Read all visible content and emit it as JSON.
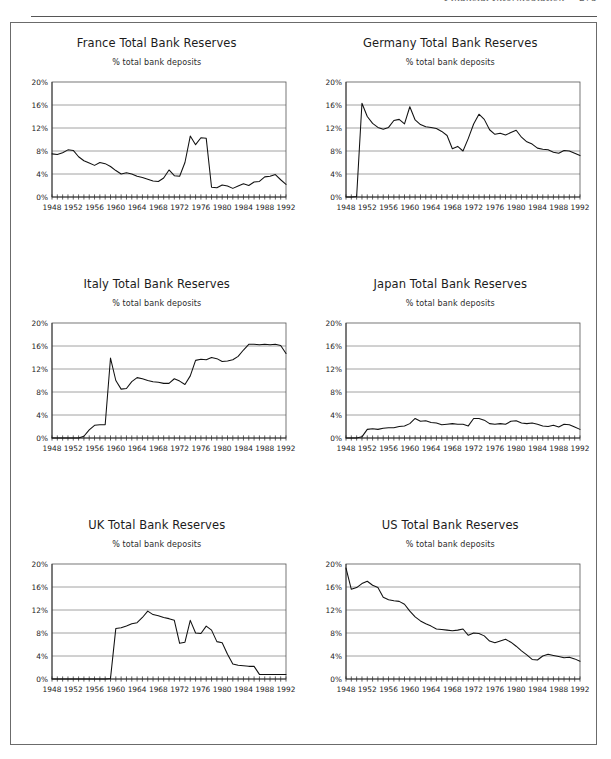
{
  "header": {
    "title": "Financial Intermediation",
    "page_number": "275"
  },
  "subtitle_text": "% total bank deposits",
  "axis": {
    "y_ticks": [
      "0%",
      "4%",
      "8%",
      "12%",
      "16%",
      "20%"
    ],
    "x_ticks": [
      "1948",
      "1952",
      "1956",
      "1960",
      "1964",
      "1968",
      "1972",
      "1976",
      "1980",
      "1984",
      "1988",
      "1992"
    ],
    "ylim": [
      0,
      20
    ],
    "xlim": [
      1948,
      1992
    ],
    "tick_interval_years": 1,
    "label_interval_years": 4,
    "gridlines": true
  },
  "panels": [
    {
      "title": "France Total Bank Reserves",
      "key": "france"
    },
    {
      "title": "Germany Total Bank Reserves",
      "key": "germany"
    },
    {
      "title": "Italy Total Bank Reserves",
      "key": "italy"
    },
    {
      "title": "Japan Total Bank Reserves",
      "key": "japan"
    },
    {
      "title": "UK Total Bank Reserves",
      "key": "uk"
    },
    {
      "title": "US Total Bank Reserves",
      "key": "us"
    }
  ],
  "chart_data": [
    {
      "type": "line",
      "title": "France Total Bank Reserves",
      "subtitle": "% total bank deposits",
      "xlabel": "",
      "ylabel": "% total bank deposits",
      "xlim": [
        1948,
        1992
      ],
      "ylim": [
        0,
        20
      ],
      "grid": true,
      "legend": "none",
      "x": [
        1948,
        1949,
        1950,
        1951,
        1952,
        1953,
        1954,
        1955,
        1956,
        1957,
        1958,
        1959,
        1960,
        1961,
        1962,
        1963,
        1964,
        1965,
        1966,
        1967,
        1968,
        1969,
        1970,
        1971,
        1972,
        1973,
        1974,
        1975,
        1976,
        1977,
        1978,
        1979,
        1980,
        1981,
        1982,
        1983,
        1984,
        1985,
        1986,
        1987,
        1988,
        1989,
        1990,
        1991,
        1992
      ],
      "values": [
        7.5,
        7.4,
        7.7,
        8.2,
        8.1,
        7.0,
        6.3,
        5.9,
        5.5,
        6.0,
        5.8,
        5.3,
        4.6,
        4.0,
        4.2,
        4.0,
        3.6,
        3.4,
        3.1,
        2.8,
        2.7,
        3.3,
        4.7,
        3.7,
        3.6,
        6.0,
        10.6,
        9.1,
        10.3,
        10.2,
        1.7,
        1.6,
        2.1,
        1.9,
        1.5,
        1.9,
        2.3,
        2.0,
        2.6,
        2.7,
        3.5,
        3.6,
        3.9,
        3.0,
        2.2,
        0.2
      ]
    },
    {
      "type": "line",
      "title": "Germany Total Bank Reserves",
      "subtitle": "% total bank deposits",
      "xlabel": "",
      "ylabel": "% total bank deposits",
      "xlim": [
        1948,
        1992
      ],
      "ylim": [
        0,
        20
      ],
      "grid": true,
      "legend": "none",
      "x": [
        1948,
        1949,
        1950,
        1951,
        1952,
        1953,
        1954,
        1955,
        1956,
        1957,
        1958,
        1959,
        1960,
        1961,
        1962,
        1963,
        1964,
        1965,
        1966,
        1967,
        1968,
        1969,
        1970,
        1971,
        1972,
        1973,
        1974,
        1975,
        1976,
        1977,
        1978,
        1979,
        1980,
        1981,
        1982,
        1983,
        1984,
        1985,
        1986,
        1987,
        1988,
        1989,
        1990,
        1991,
        1992
      ],
      "values": [
        0.0,
        0.0,
        0.1,
        16.3,
        14.0,
        12.8,
        12.1,
        11.8,
        12.1,
        13.3,
        13.5,
        12.7,
        15.7,
        13.4,
        12.6,
        12.2,
        12.1,
        11.9,
        11.4,
        10.7,
        8.4,
        8.8,
        8.0,
        10.2,
        12.7,
        14.4,
        13.5,
        11.7,
        10.9,
        11.1,
        10.8,
        11.2,
        11.6,
        10.4,
        9.6,
        9.2,
        8.5,
        8.3,
        8.2,
        7.8,
        7.6,
        8.1,
        8.0,
        7.6,
        7.2
      ]
    },
    {
      "type": "line",
      "title": "Italy Total Bank Reserves",
      "subtitle": "% total bank deposits",
      "xlabel": "",
      "ylabel": "% total bank deposits",
      "xlim": [
        1948,
        1992
      ],
      "ylim": [
        0,
        20
      ],
      "grid": true,
      "legend": "none",
      "x": [
        1948,
        1949,
        1950,
        1951,
        1952,
        1953,
        1954,
        1955,
        1956,
        1957,
        1958,
        1959,
        1960,
        1961,
        1962,
        1963,
        1964,
        1965,
        1966,
        1967,
        1968,
        1969,
        1970,
        1971,
        1972,
        1973,
        1974,
        1975,
        1976,
        1977,
        1978,
        1979,
        1980,
        1981,
        1982,
        1983,
        1984,
        1985,
        1986,
        1987,
        1988,
        1989,
        1990,
        1991,
        1992
      ],
      "values": [
        0.0,
        0.0,
        0.0,
        0.0,
        0.0,
        0.0,
        0.3,
        1.4,
        2.2,
        2.3,
        2.3,
        13.9,
        10.0,
        8.5,
        8.6,
        9.8,
        10.5,
        10.3,
        10.0,
        9.8,
        9.7,
        9.5,
        9.5,
        10.3,
        9.9,
        9.3,
        10.8,
        13.5,
        13.7,
        13.6,
        14.0,
        13.8,
        13.3,
        13.4,
        13.6,
        14.2,
        15.3,
        16.3,
        16.3,
        16.2,
        16.3,
        16.2,
        16.3,
        16.1,
        14.7
      ]
    },
    {
      "type": "line",
      "title": "Japan Total Bank Reserves",
      "subtitle": "% total bank deposits",
      "xlabel": "",
      "ylabel": "% total bank deposits",
      "xlim": [
        1948,
        1992
      ],
      "ylim": [
        0,
        20
      ],
      "grid": true,
      "legend": "none",
      "x": [
        1948,
        1949,
        1950,
        1951,
        1952,
        1953,
        1954,
        1955,
        1956,
        1957,
        1958,
        1959,
        1960,
        1961,
        1962,
        1963,
        1964,
        1965,
        1966,
        1967,
        1968,
        1969,
        1970,
        1971,
        1972,
        1973,
        1974,
        1975,
        1976,
        1977,
        1978,
        1979,
        1980,
        1981,
        1982,
        1983,
        1984,
        1985,
        1986,
        1987,
        1988,
        1989,
        1990,
        1991,
        1992
      ],
      "values": [
        0.0,
        0.0,
        0.0,
        0.2,
        1.5,
        1.6,
        1.5,
        1.7,
        1.8,
        1.8,
        2.0,
        2.1,
        2.5,
        3.4,
        2.9,
        3.0,
        2.7,
        2.6,
        2.3,
        2.4,
        2.5,
        2.4,
        2.4,
        2.1,
        3.4,
        3.4,
        3.1,
        2.5,
        2.4,
        2.5,
        2.4,
        2.9,
        3.0,
        2.6,
        2.5,
        2.6,
        2.4,
        2.1,
        2.0,
        2.2,
        1.9,
        2.4,
        2.3,
        1.9,
        1.5
      ]
    },
    {
      "type": "line",
      "title": "UK Total Bank Reserves",
      "subtitle": "% total bank deposits",
      "xlabel": "",
      "ylabel": "% total bank deposits",
      "xlim": [
        1948,
        1992
      ],
      "ylim": [
        0,
        20
      ],
      "grid": true,
      "legend": "none",
      "x": [
        1948,
        1949,
        1950,
        1951,
        1952,
        1953,
        1954,
        1955,
        1956,
        1957,
        1958,
        1959,
        1960,
        1961,
        1962,
        1963,
        1964,
        1965,
        1966,
        1967,
        1968,
        1969,
        1970,
        1971,
        1972,
        1973,
        1974,
        1975,
        1976,
        1977,
        1978,
        1979,
        1980,
        1981,
        1982,
        1983,
        1984,
        1985,
        1986,
        1987,
        1988,
        1989,
        1990,
        1991,
        1992
      ],
      "values": [
        0.0,
        0.0,
        0.0,
        0.0,
        0.0,
        0.0,
        0.0,
        0.0,
        0.0,
        0.0,
        0.0,
        0.1,
        8.8,
        8.9,
        9.2,
        9.6,
        9.8,
        10.7,
        11.8,
        11.2,
        11.0,
        10.7,
        10.5,
        10.2,
        6.2,
        6.4,
        10.2,
        8.0,
        7.9,
        9.2,
        8.5,
        6.5,
        6.3,
        4.3,
        2.6,
        2.4,
        2.3,
        2.2,
        2.2,
        0.8,
        0.8,
        0.8,
        0.8,
        0.8,
        0.8
      ]
    },
    {
      "type": "line",
      "title": "US Total Bank Reserves",
      "subtitle": "% total bank deposits",
      "xlabel": "",
      "ylabel": "% total bank deposits",
      "xlim": [
        1948,
        1992
      ],
      "ylim": [
        0,
        20
      ],
      "grid": true,
      "legend": "none",
      "x": [
        1948,
        1949,
        1950,
        1951,
        1952,
        1953,
        1954,
        1955,
        1956,
        1957,
        1958,
        1959,
        1960,
        1961,
        1962,
        1963,
        1964,
        1965,
        1966,
        1967,
        1968,
        1969,
        1970,
        1971,
        1972,
        1973,
        1974,
        1975,
        1976,
        1977,
        1978,
        1979,
        1980,
        1981,
        1982,
        1983,
        1984,
        1985,
        1986,
        1987,
        1988,
        1989,
        1990,
        1991,
        1992
      ],
      "values": [
        19.3,
        15.6,
        15.9,
        16.6,
        17.0,
        16.3,
        15.9,
        14.2,
        13.8,
        13.6,
        13.5,
        13.0,
        11.8,
        10.8,
        10.1,
        9.6,
        9.2,
        8.7,
        8.6,
        8.5,
        8.4,
        8.5,
        8.7,
        7.6,
        8.0,
        7.9,
        7.5,
        6.6,
        6.3,
        6.6,
        6.9,
        6.4,
        5.7,
        4.9,
        4.2,
        3.4,
        3.3,
        4.0,
        4.3,
        4.1,
        3.9,
        3.7,
        3.8,
        3.5,
        3.1
      ]
    }
  ]
}
